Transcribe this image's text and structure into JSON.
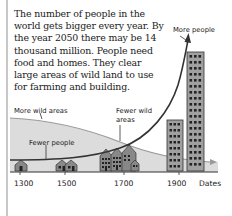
{
  "paragraph": {
    "lines": [
      "The number of people in the",
      "world gets bigger every year. By",
      "the year 2050 there may be 14",
      "thousand million. People need",
      "food and homes. They clear",
      "large areas of wild land to use",
      "for  farming and building."
    ]
  },
  "diagram": {
    "labels": {
      "more_wild_areas": "More wild areas",
      "fewer_wild_areas_1": "Fewer wild",
      "fewer_wild_areas_2": "areas",
      "fewer_people": "Fewer people",
      "more_people": "More people"
    },
    "axis": {
      "ticks": [
        "1300",
        "1500",
        "1700",
        "1900"
      ],
      "title": "Dates"
    },
    "colors": {
      "wild_area_fill": "#dcdcdc",
      "wild_area_line": "#9a9a9a",
      "population_curve": "#333333",
      "building_fill": "#a0a0a0",
      "house_fill": "#888888"
    }
  }
}
